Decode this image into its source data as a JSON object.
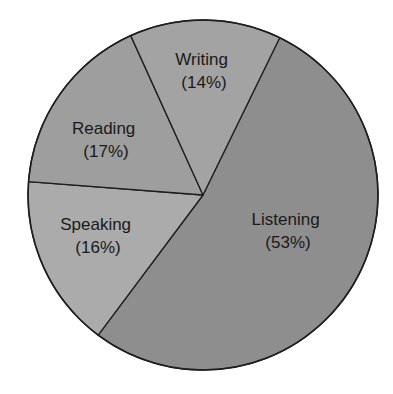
{
  "chart_data": {
    "type": "pie",
    "title": "",
    "categories": [
      "Listening",
      "Speaking",
      "Reading",
      "Writing"
    ],
    "values": [
      53,
      16,
      17,
      14
    ],
    "unit": "%",
    "labels": [
      "Listening (53%)",
      "Speaking (16%)",
      "Reading (17%)",
      "Writing (14%)"
    ],
    "legend": "none (labels drawn inside slices)",
    "start_angle_deg": -64,
    "direction": "clockwise",
    "slices": [
      {
        "name": "Listening",
        "value": 53,
        "percent_label": "(53%)",
        "color": "#8e8e8e",
        "label_x": 288,
        "label_y": 225
      },
      {
        "name": "Speaking",
        "value": 16,
        "percent_label": "(16%)",
        "color": "#ababab",
        "label_x": 98,
        "label_y": 230
      },
      {
        "name": "Reading",
        "value": 17,
        "percent_label": "(17%)",
        "color": "#9e9e9e",
        "label_x": 106,
        "label_y": 134
      },
      {
        "name": "Writing",
        "value": 14,
        "percent_label": "(14%)",
        "color": "#a3a3a3",
        "label_x": 204,
        "label_y": 65
      }
    ]
  },
  "geometry": {
    "cx": 203,
    "cy": 195,
    "r": 175,
    "stroke_color": "#1e1e1e",
    "background": "#ffffff"
  }
}
